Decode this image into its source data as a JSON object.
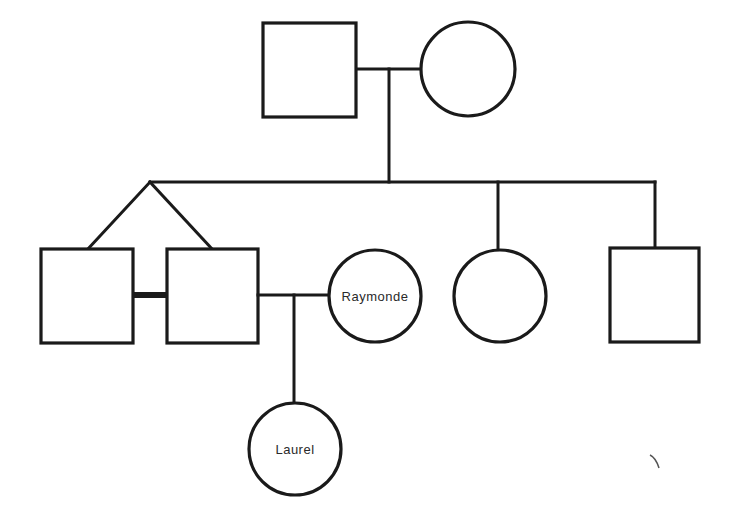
{
  "diagram": {
    "type": "pedigree-chart",
    "generations": [
      {
        "level": 1,
        "members": [
          {
            "id": "grandfather",
            "sex": "male",
            "shape": "square",
            "label": ""
          },
          {
            "id": "grandmother",
            "sex": "female",
            "shape": "circle",
            "label": ""
          }
        ]
      },
      {
        "level": 2,
        "members": [
          {
            "id": "twin-1",
            "sex": "male",
            "shape": "square",
            "label": "",
            "twin": true
          },
          {
            "id": "twin-2",
            "sex": "male",
            "shape": "square",
            "label": "",
            "twin": true
          },
          {
            "id": "spouse-raymonde",
            "sex": "female",
            "shape": "circle",
            "label": "Raymonde"
          },
          {
            "id": "sister",
            "sex": "female",
            "shape": "circle",
            "label": ""
          },
          {
            "id": "brother",
            "sex": "male",
            "shape": "square",
            "label": ""
          }
        ]
      },
      {
        "level": 3,
        "members": [
          {
            "id": "child-laurel",
            "sex": "female",
            "shape": "circle",
            "label": "Laurel"
          }
        ]
      }
    ],
    "relationships": [
      {
        "type": "marriage",
        "between": [
          "grandfather",
          "grandmother"
        ]
      },
      {
        "type": "twins",
        "between": [
          "twin-1",
          "twin-2"
        ]
      },
      {
        "type": "identical-twin-bar",
        "between": [
          "twin-1",
          "twin-2"
        ]
      },
      {
        "type": "marriage",
        "between": [
          "twin-2",
          "spouse-raymonde"
        ]
      },
      {
        "type": "child-of",
        "child": "child-laurel",
        "parents": [
          "twin-2",
          "spouse-raymonde"
        ]
      }
    ],
    "labels": {
      "raymonde": "Raymonde",
      "laurel": "Laurel"
    }
  }
}
